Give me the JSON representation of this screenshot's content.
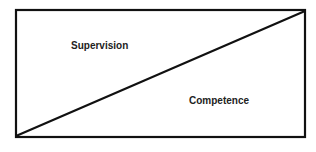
{
  "diagram": {
    "regions": [
      {
        "id": "upper-left",
        "label": "Supervision"
      },
      {
        "id": "lower-right",
        "label": "Competence"
      }
    ],
    "colors": {
      "stroke": "#111111",
      "text": "#222222",
      "background": "#ffffff"
    }
  }
}
